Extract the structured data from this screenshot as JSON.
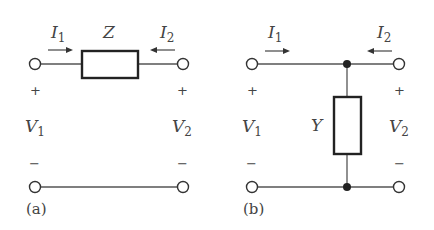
{
  "figure": {
    "panels": [
      {
        "id": "a",
        "caption": "(a)",
        "element_label": "Z",
        "element_orientation": "series",
        "current_left": {
          "symbol": "I",
          "sub": "1"
        },
        "current_right": {
          "symbol": "I",
          "sub": "2"
        },
        "voltage_left": {
          "symbol": "V",
          "sub": "1",
          "plus": "+",
          "minus": "−"
        },
        "voltage_right": {
          "symbol": "V",
          "sub": "2",
          "plus": "+",
          "minus": "−"
        }
      },
      {
        "id": "b",
        "caption": "(b)",
        "element_label": "Y",
        "element_orientation": "shunt",
        "current_left": {
          "symbol": "I",
          "sub": "1"
        },
        "current_right": {
          "symbol": "I",
          "sub": "2"
        },
        "voltage_left": {
          "symbol": "V",
          "sub": "1",
          "plus": "+",
          "minus": "−"
        },
        "voltage_right": {
          "symbol": "V",
          "sub": "2",
          "plus": "+",
          "minus": "−"
        }
      }
    ]
  }
}
